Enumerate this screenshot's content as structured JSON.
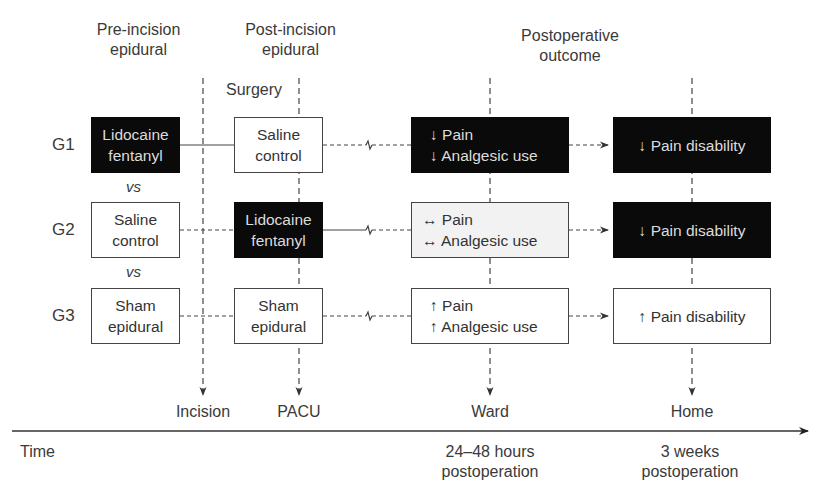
{
  "headers": {
    "pre": [
      "Pre-incision",
      "epidural"
    ],
    "post": [
      "Post-incision",
      "epidural"
    ],
    "surgery": "Surgery",
    "outcome": [
      "Postoperative",
      "outcome"
    ]
  },
  "groups": [
    {
      "label": "G1",
      "pre": {
        "lines": [
          "Lidocaine",
          "fentanyl"
        ],
        "style": "dark"
      },
      "post": {
        "lines": [
          "Saline",
          "control"
        ],
        "style": "white"
      },
      "ward": {
        "lines": [
          "↓ Pain",
          "↓ Analgesic use"
        ],
        "style": "dark"
      },
      "home": {
        "lines": [
          "↓ Pain disability"
        ],
        "style": "dark"
      }
    },
    {
      "label": "G2",
      "pre": {
        "lines": [
          "Saline",
          "control"
        ],
        "style": "white"
      },
      "post": {
        "lines": [
          "Lidocaine",
          "fentanyl"
        ],
        "style": "dark"
      },
      "ward": {
        "lines": [
          "↔ Pain",
          "↔ Analgesic use"
        ],
        "style": "light"
      },
      "home": {
        "lines": [
          "↓ Pain disability"
        ],
        "style": "dark"
      }
    },
    {
      "label": "G3",
      "pre": {
        "lines": [
          "Sham",
          "epidural"
        ],
        "style": "white"
      },
      "post": {
        "lines": [
          "Sham",
          "epidural"
        ],
        "style": "white"
      },
      "ward": {
        "lines": [
          "↑ Pain",
          "↑ Analgesic use"
        ],
        "style": "white"
      },
      "home": {
        "lines": [
          "↑ Pain disability"
        ],
        "style": "white"
      }
    }
  ],
  "vs_label": "vs",
  "timeline": {
    "axis_label": "Time",
    "events": [
      "Incision",
      "PACU",
      "Ward",
      "Home"
    ],
    "ward_time": [
      "24–48 hours",
      "postoperation"
    ],
    "home_time": [
      "3 weeks",
      "postoperation"
    ]
  },
  "colors": {
    "dark_fill": "#0a0a0a",
    "light_fill": "#f2f2f2",
    "line": "#444444"
  }
}
